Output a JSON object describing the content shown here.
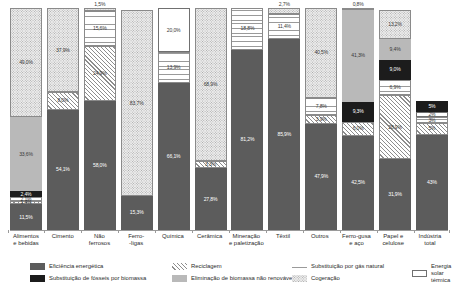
{
  "chart_data": {
    "type": "bar",
    "stacked": true,
    "title": "",
    "subtitle": "",
    "xlabel": "",
    "ylabel": "",
    "ylim": [
      0,
      100
    ],
    "grid": false,
    "legend_position": "bottom",
    "value_suffix": "%",
    "categories": [
      "Alimentos\ne bebidas",
      "Cimento",
      "Não\nferrosos",
      "Ferro-\n-ligas",
      "Química",
      "Cerâmica",
      "Mineração\ne paletização",
      "Têxtil",
      "Outros",
      "Ferro-gusa\ne aço",
      "Papel e\ncelulose",
      "Indústria\ntotal"
    ],
    "series": [
      {
        "name": "Eficiência energética",
        "key": "efic",
        "pattern": "p-efic",
        "color": "#5c5c5c",
        "values": [
          11.5,
          54.1,
          58.0,
          15.3,
          66.1,
          27.8,
          81.2,
          85.9,
          47.9,
          42.5,
          31.9,
          43.0
        ],
        "labels": [
          "11,5%",
          "54,1%",
          "58,0%",
          "15,3%",
          "66,1%",
          "27,8%",
          "81,2%",
          "85,9%",
          "47,9%",
          "42,5%",
          "31,9%",
          "43%"
        ]
      },
      {
        "name": "Substituição de fósseis por biomassa",
        "key": "bio",
        "pattern": "p-bio",
        "color": "#1c1c1c",
        "values": [
          1.2,
          0,
          0,
          0,
          0,
          0,
          0,
          0,
          0,
          0,
          0,
          0
        ],
        "labels": [
          "",
          "",
          "",
          "",
          "",
          "",
          "",
          "",
          "",
          "",
          "",
          ""
        ]
      },
      {
        "name": "Reciclagem",
        "key": "recic",
        "pattern": "p-recic",
        "color": "#ffffff",
        "values": [
          1.6,
          0,
          0,
          0,
          0,
          0,
          0,
          0,
          3.9,
          6.0,
          28.9,
          5.0
        ],
        "labels": [
          "",
          "",
          "",
          "",
          "",
          "",
          "",
          "",
          "3,9%",
          "6,0%",
          "28,9%",
          "5%"
        ]
      },
      {
        "name": "Eliminação de biomassa não renovável",
        "key": "elim",
        "pattern": "p-elim",
        "color": "#b9b9b9",
        "values": [
          0,
          0,
          0,
          0,
          0,
          0,
          0,
          0,
          0,
          9.3,
          0,
          0
        ],
        "labels": [
          "",
          "",
          "",
          "",
          "",
          "",
          "",
          "",
          "",
          "9,3%",
          "",
          ""
        ]
      },
      {
        "name": "Substituição por gás natural",
        "key": "gas",
        "pattern": "p-gas",
        "color": "#ffffff",
        "values": [
          2.1,
          0,
          0,
          0,
          13.9,
          0,
          18.8,
          11.4,
          7.8,
          0,
          6.9,
          3.0
        ],
        "labels": [
          "",
          "",
          "",
          "",
          "13,9%",
          "",
          "18,8%",
          "11,4%",
          "7,8%",
          "",
          "6,9%",
          "3%"
        ]
      },
      {
        "name": "Cogeração",
        "key": "coger",
        "pattern": "p-coger",
        "color": "#ececec",
        "values": [
          49.0,
          0,
          0,
          0,
          0,
          0,
          0,
          0,
          0,
          0,
          13.2,
          0
        ],
        "labels": [
          "49,0%",
          "",
          "",
          "",
          "",
          "",
          "",
          "",
          "",
          "",
          "13,2%",
          ""
        ]
      },
      {
        "name": "Energia solar térmica",
        "key": "solar",
        "pattern": "p-solar",
        "color": "#ffffff",
        "values": [
          0,
          0,
          0,
          0,
          20.0,
          0,
          0,
          0,
          0,
          0,
          0,
          2.0
        ],
        "labels": [
          "",
          "",
          "",
          "",
          "20,0%",
          "",
          "",
          "",
          "",
          "",
          "",
          "2%"
        ]
      }
    ],
    "columns": [
      {
        "category": "Alimentos\ne bebidas",
        "total": 100,
        "segments": [
          {
            "series": "Cogeração",
            "pattern": "p-coger",
            "value": 49.0,
            "label": "49,0%",
            "label_style": "lbl-light",
            "label_pos": "in"
          },
          {
            "series": "Eliminação de biomassa não renovável",
            "pattern": "p-elim",
            "value": 33.6,
            "label": "33,6%",
            "label_style": "lbl-light",
            "label_pos": "in"
          },
          {
            "series": "Substituição de fósseis por biomassa",
            "pattern": "p-bio",
            "value": 2.4,
            "label": "2,4%",
            "label_style": "lbl-dark",
            "label_pos": "in"
          },
          {
            "series": "Substituição por gás natural",
            "pattern": "p-gas",
            "value": 2.1,
            "label": "2,1%",
            "label_style": "lbl-light",
            "label_pos": "in"
          },
          {
            "series": "Reciclagem",
            "pattern": "p-recic",
            "value": 1.4,
            "label": "1,4%",
            "label_style": "lbl-light",
            "label_pos": "in"
          },
          {
            "series": "Eficiência energética",
            "pattern": "p-efic",
            "value": 11.5,
            "label": "11,5%",
            "label_style": "lbl-dark",
            "label_pos": "in"
          }
        ]
      },
      {
        "category": "Cimento",
        "total": 100,
        "segments": [
          {
            "series": "Cogeração",
            "pattern": "p-coger",
            "value": 37.9,
            "label": "37,9%",
            "label_style": "lbl-light",
            "label_pos": "in"
          },
          {
            "series": "Reciclagem",
            "pattern": "p-recic",
            "value": 8.0,
            "label": "8,0%",
            "label_style": "lbl-light",
            "label_pos": "in"
          },
          {
            "series": "Eficiência energética",
            "pattern": "p-efic",
            "value": 54.1,
            "label": "54,1%",
            "label_style": "lbl-dark",
            "label_pos": "in"
          }
        ]
      },
      {
        "category": "Não\nferrosos",
        "total": 100,
        "segments": [
          {
            "series": "Cogeração",
            "pattern": "p-coger",
            "value": 1.5,
            "label": "1,5%",
            "label_style": "lbl-light",
            "label_pos": "out"
          },
          {
            "series": "Substituição por gás natural",
            "pattern": "p-gas",
            "value": 15.6,
            "label": "15,6%",
            "label_style": "lbl-light",
            "label_pos": "in"
          },
          {
            "series": "Reciclagem",
            "pattern": "p-recic",
            "value": 24.9,
            "label": "24,9%",
            "label_style": "lbl-light",
            "label_pos": "in"
          },
          {
            "series": "Eficiência energética",
            "pattern": "p-efic",
            "value": 58.0,
            "label": "58,0%",
            "label_style": "lbl-dark",
            "label_pos": "in"
          }
        ]
      },
      {
        "category": "Ferro-\n-ligas",
        "total": 100,
        "segments": [
          {
            "series": "Cogeração",
            "pattern": "p-coger",
            "value": 83.7,
            "label": "83,7%",
            "label_style": "lbl-light",
            "label_pos": "in"
          },
          {
            "series": "Eficiência energética",
            "pattern": "p-efic",
            "value": 15.3,
            "label": "15,3%",
            "label_style": "lbl-dark",
            "label_pos": "in"
          }
        ]
      },
      {
        "category": "Química",
        "total": 100,
        "segments": [
          {
            "series": "Energia solar térmica",
            "pattern": "p-solar",
            "value": 20.0,
            "label": "20,0%",
            "label_style": "lbl-light",
            "label_pos": "in"
          },
          {
            "series": "Substituição por gás natural",
            "pattern": "p-gas",
            "value": 13.9,
            "label": "13,9%",
            "label_style": "lbl-light",
            "label_pos": "in"
          },
          {
            "series": "Eficiência energética",
            "pattern": "p-efic",
            "value": 66.1,
            "label": "66,1%",
            "label_style": "lbl-dark",
            "label_pos": "in"
          }
        ]
      },
      {
        "category": "Cerâmica",
        "total": 100,
        "segments": [
          {
            "series": "Cogeração",
            "pattern": "p-coger",
            "value": 68.9,
            "label": "68,9%",
            "label_style": "lbl-light",
            "label_pos": "in"
          },
          {
            "series": "Reciclagem",
            "pattern": "p-recic",
            "value": 3.3,
            "label": "3,3%",
            "label_style": "lbl-light",
            "label_pos": "in"
          },
          {
            "series": "Eficiência energética",
            "pattern": "p-efic",
            "value": 27.8,
            "label": "27,8%",
            "label_style": "lbl-dark",
            "label_pos": "in"
          }
        ]
      },
      {
        "category": "Mineração\ne paletização",
        "total": 100,
        "segments": [
          {
            "series": "Substituição por gás natural",
            "pattern": "p-gas",
            "value": 18.8,
            "label": "18,8%",
            "label_style": "lbl-light",
            "label_pos": "in"
          },
          {
            "series": "Eficiência energética",
            "pattern": "p-efic",
            "value": 81.2,
            "label": "81,2%",
            "label_style": "lbl-dark",
            "label_pos": "in"
          }
        ]
      },
      {
        "category": "Têxtil",
        "total": 100,
        "segments": [
          {
            "series": "Cogeração",
            "pattern": "p-coger",
            "value": 2.7,
            "label": "2,7%",
            "label_style": "lbl-light",
            "label_pos": "out"
          },
          {
            "series": "Substituição por gás natural",
            "pattern": "p-gas",
            "value": 11.4,
            "label": "11,4%",
            "label_style": "lbl-light",
            "label_pos": "in"
          },
          {
            "series": "Eficiência energética",
            "pattern": "p-efic",
            "value": 85.9,
            "label": "85,9%",
            "label_style": "lbl-dark",
            "label_pos": "in"
          }
        ]
      },
      {
        "category": "Outros",
        "total": 100,
        "segments": [
          {
            "series": "Cogeração",
            "pattern": "p-coger",
            "value": 40.5,
            "label": "40,5%",
            "label_style": "lbl-light",
            "label_pos": "in"
          },
          {
            "series": "Substituição por gás natural",
            "pattern": "p-gas",
            "value": 7.8,
            "label": "7,8%",
            "label_style": "lbl-light",
            "label_pos": "in"
          },
          {
            "series": "Reciclagem",
            "pattern": "p-recic",
            "value": 3.9,
            "label": "3,9%",
            "label_style": "lbl-light",
            "label_pos": "in"
          },
          {
            "series": "Eficiência energética",
            "pattern": "p-efic",
            "value": 47.9,
            "label": "47,9%",
            "label_style": "lbl-dark",
            "label_pos": "in"
          }
        ]
      },
      {
        "category": "Ferro-gusa\ne aço",
        "total": 100,
        "segments": [
          {
            "series": "Cogeração",
            "pattern": "p-coger",
            "value": 0.8,
            "label": "0,8%",
            "label_style": "lbl-light",
            "label_pos": "out"
          },
          {
            "series": "Eliminação de biomassa não renovável",
            "pattern": "p-elim",
            "value": 41.3,
            "label": "41,3%",
            "label_style": "lbl-light",
            "label_pos": "in"
          },
          {
            "series": "Substituição de fósseis por biomassa",
            "pattern": "p-bio",
            "value": 9.3,
            "label": "9,3%",
            "label_style": "lbl-dark",
            "label_pos": "in"
          },
          {
            "series": "Reciclagem",
            "pattern": "p-recic",
            "value": 6.0,
            "label": "6,0%",
            "label_style": "lbl-light",
            "label_pos": "in"
          },
          {
            "series": "Eficiência energética",
            "pattern": "p-efic",
            "value": 42.5,
            "label": "42,5%",
            "label_style": "lbl-dark",
            "label_pos": "in"
          }
        ]
      },
      {
        "category": "Papel e\ncelulose",
        "total": 100,
        "segments": [
          {
            "series": "Cogeração",
            "pattern": "p-coger",
            "value": 13.2,
            "label": "13,2%",
            "label_style": "lbl-light",
            "label_pos": "in"
          },
          {
            "series": "Eliminação de biomassa não renovável",
            "pattern": "p-elim",
            "value": 9.4,
            "label": "9,4%",
            "label_style": "lbl-light",
            "label_pos": "in"
          },
          {
            "series": "Substituição de fósseis por biomassa",
            "pattern": "p-bio",
            "value": 9.0,
            "label": "9,0%",
            "label_style": "lbl-dark",
            "label_pos": "in"
          },
          {
            "series": "Substituição por gás natural",
            "pattern": "p-gas",
            "value": 6.9,
            "label": "6,9%",
            "label_style": "lbl-light",
            "label_pos": "in"
          },
          {
            "series": "Reciclagem",
            "pattern": "p-recic",
            "value": 28.9,
            "label": "28,9%",
            "label_style": "lbl-light",
            "label_pos": "in"
          },
          {
            "series": "Eficiência energética",
            "pattern": "p-efic",
            "value": 31.9,
            "label": "31,9%",
            "label_style": "lbl-dark",
            "label_pos": "in"
          }
        ]
      },
      {
        "category": "Indústria\ntotal",
        "total": 100,
        "segments": [
          {
            "series": "Substituição de fósseis por biomassa",
            "pattern": "p-bio",
            "value": 5.0,
            "label": "5%",
            "label_style": "lbl-dark",
            "label_pos": "in"
          },
          {
            "series": "Energia solar térmica",
            "pattern": "p-solar",
            "value": 2.0,
            "label": "2%",
            "label_style": "lbl-light",
            "label_pos": "in"
          },
          {
            "series": "Substituição por gás natural",
            "pattern": "p-gas",
            "value": 3.0,
            "label": "3%",
            "label_style": "lbl-light",
            "label_pos": "in"
          },
          {
            "series": "Reciclagem",
            "pattern": "p-recic",
            "value": 5.0,
            "label": "5%",
            "label_style": "lbl-light",
            "label_pos": "in"
          },
          {
            "series": "Eficiência energética",
            "pattern": "p-efic",
            "value": 43.0,
            "label": "43%",
            "label_style": "lbl-dark",
            "label_pos": "in"
          }
        ]
      }
    ],
    "legend": [
      {
        "label": "Eficiência energética",
        "pattern": "p-efic",
        "row": 1,
        "col": 1
      },
      {
        "label": "Substituição de fósseis por biomassa",
        "pattern": "p-bio",
        "row": 2,
        "col": 1
      },
      {
        "label": "Reciclagem",
        "pattern": "p-recic",
        "row": 1,
        "col": 2
      },
      {
        "label": "Eliminação de biomassa não renovável",
        "pattern": "p-elim",
        "row": 2,
        "col": 2
      },
      {
        "label": "Substituição por gás natural",
        "pattern": "p-gas",
        "row": 1,
        "col": 3
      },
      {
        "label": "Cogeração",
        "pattern": "p-coger",
        "row": 2,
        "col": 3
      },
      {
        "label": "Energia solar\ntérmica",
        "pattern": "p-solar",
        "row": 1,
        "col": 4
      }
    ]
  }
}
